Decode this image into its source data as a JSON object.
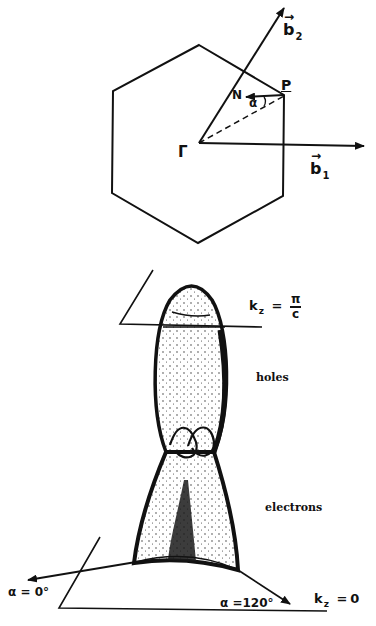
{
  "figure": {
    "top_panel": {
      "description": "Hexagonal Brillouin zone cross-section",
      "center_label": "Γ",
      "corner_label": "P",
      "normal_label": "N",
      "angle_label": "α",
      "vectors": [
        {
          "name": "b",
          "subscript": "2",
          "arrow": "→"
        },
        {
          "name": "b",
          "subscript": "1",
          "arrow": "→"
        }
      ]
    },
    "bottom_panel": {
      "description": "Fermi surface sheet between two kz planes",
      "top_plane": {
        "lhs": "k",
        "sub": "z",
        "eq": "=",
        "num": "π",
        "den": "c"
      },
      "bottom_plane": {
        "lhs": "k",
        "sub": "z",
        "eq": "=",
        "rhs": "0"
      },
      "upper_region_label": "holes",
      "lower_region_label": "electrons",
      "direction_left": "α = 0°",
      "direction_right": "α =120°"
    },
    "colors": {
      "ink": "#111111",
      "background": "#ffffff"
    }
  }
}
